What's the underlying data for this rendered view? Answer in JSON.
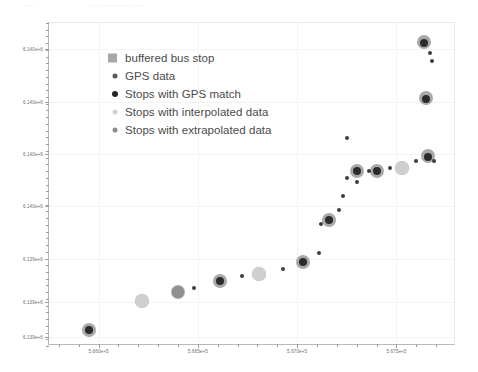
{
  "top_artifact": {
    "left_text": "——",
    "right_text": "— — ———— ——"
  },
  "legend": {
    "entries": [
      {
        "label": "buffered bus stop",
        "marker": "square-swatch",
        "color": "#a8a8a8",
        "size": 9
      },
      {
        "label": "GPS data",
        "marker": "circle-dot-small",
        "color": "#5a5a5a",
        "size": 5
      },
      {
        "label": "Stops with GPS match",
        "marker": "circle-dot-dark",
        "color": "#262626",
        "size": 6
      },
      {
        "label": "Stops with interpolated data",
        "marker": "circle-dot-light",
        "color": "#d2d2d2",
        "size": 5
      },
      {
        "label": "Stops with extrapolated data",
        "marker": "circle-dot-mid",
        "color": "#8d8d8d",
        "size": 5
      }
    ]
  },
  "chart_data": {
    "type": "scatter",
    "title": "",
    "xlabel": "",
    "ylabel": "",
    "grid": true,
    "legend_position": "upper left",
    "xlim": [
      565750,
      567800
    ],
    "ylim": [
      6138700,
      6140550
    ],
    "xticks": [
      {
        "value": 566000,
        "label": "5.660e+5"
      },
      {
        "value": 566500,
        "label": "5.665e+5"
      },
      {
        "value": 567000,
        "label": "5.670e+5"
      },
      {
        "value": 567500,
        "label": "5.675e+5"
      }
    ],
    "xminorticks": [
      565800,
      565900,
      566100,
      566200,
      566300,
      566400,
      566600,
      566700,
      566800,
      566900,
      567100,
      567200,
      567300,
      567400,
      567600,
      567700
    ],
    "yticks": [
      {
        "value": 6140400,
        "label": "6.140e+6"
      },
      {
        "value": 6140100,
        "label": "6.140e+6"
      },
      {
        "value": 6139800,
        "label": "6.140e+6"
      },
      {
        "value": 6139500,
        "label": "6.140e+6"
      },
      {
        "value": 6139200,
        "label": "6.139e+6"
      },
      {
        "value": 6138950,
        "label": "6.139e+6"
      },
      {
        "value": 6138750,
        "label": "6.139e+6"
      }
    ],
    "series": [
      {
        "name": "buffered bus stop",
        "marker": "circle",
        "color": "#a9a9a9",
        "radius_px": 7,
        "points": [
          {
            "x": 565950,
            "y": 6138790
          },
          {
            "x": 566220,
            "y": 6138960
          },
          {
            "x": 566400,
            "y": 6139010
          },
          {
            "x": 566610,
            "y": 6139070
          },
          {
            "x": 566810,
            "y": 6139110
          },
          {
            "x": 567030,
            "y": 6139180
          },
          {
            "x": 567160,
            "y": 6139420
          },
          {
            "x": 567300,
            "y": 6139700
          },
          {
            "x": 567400,
            "y": 6139700
          },
          {
            "x": 567530,
            "y": 6139720
          },
          {
            "x": 567660,
            "y": 6139790
          },
          {
            "x": 567650,
            "y": 6140120
          },
          {
            "x": 567640,
            "y": 6140440
          }
        ]
      },
      {
        "name": "Stops with GPS match",
        "marker": "circle",
        "color": "#2b2b2b",
        "radius_px": 4,
        "points": [
          {
            "x": 565950,
            "y": 6138790
          },
          {
            "x": 566610,
            "y": 6139070
          },
          {
            "x": 567030,
            "y": 6139180
          },
          {
            "x": 567160,
            "y": 6139420
          },
          {
            "x": 567300,
            "y": 6139700
          },
          {
            "x": 567400,
            "y": 6139700
          },
          {
            "x": 567660,
            "y": 6139780
          },
          {
            "x": 567650,
            "y": 6140115
          },
          {
            "x": 567640,
            "y": 6140435
          }
        ]
      },
      {
        "name": "GPS data",
        "marker": "circle",
        "color": "#3d3d3d",
        "radius_px": 2,
        "points": [
          {
            "x": 566480,
            "y": 6139030
          },
          {
            "x": 566720,
            "y": 6139100
          },
          {
            "x": 566930,
            "y": 6139140
          },
          {
            "x": 567110,
            "y": 6139230
          },
          {
            "x": 567120,
            "y": 6139400
          },
          {
            "x": 567210,
            "y": 6139480
          },
          {
            "x": 567230,
            "y": 6139560
          },
          {
            "x": 567250,
            "y": 6139660
          },
          {
            "x": 567300,
            "y": 6139640
          },
          {
            "x": 567360,
            "y": 6139700
          },
          {
            "x": 567470,
            "y": 6139720
          },
          {
            "x": 567600,
            "y": 6139760
          },
          {
            "x": 567690,
            "y": 6139760
          },
          {
            "x": 567250,
            "y": 6139890
          },
          {
            "x": 567670,
            "y": 6140380
          },
          {
            "x": 567680,
            "y": 6140330
          }
        ]
      },
      {
        "name": "Stops with interpolated data",
        "marker": "circle",
        "color": "#cfcfcf",
        "radius_px": 7,
        "points": [
          {
            "x": 566220,
            "y": 6138960
          },
          {
            "x": 566810,
            "y": 6139110
          },
          {
            "x": 567530,
            "y": 6139720
          }
        ]
      },
      {
        "name": "Stops with extrapolated data",
        "marker": "circle",
        "color": "#8f8f8f",
        "radius_px": 6,
        "points": [
          {
            "x": 566400,
            "y": 6139010
          }
        ]
      }
    ]
  }
}
